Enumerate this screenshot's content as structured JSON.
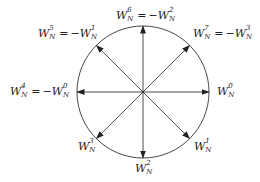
{
  "diagram": {
    "circle": {
      "cx": 143,
      "cy": 92,
      "r": 66,
      "stroke": "#333333"
    },
    "arrow_color": "#222222",
    "labels": [
      {
        "id": "k0",
        "base": "W",
        "sub": "N",
        "sup": "0",
        "text": "W_N^0",
        "equals": ""
      },
      {
        "id": "k1",
        "base": "W",
        "sub": "N",
        "sup": "1",
        "text": "W_N^1",
        "equals": ""
      },
      {
        "id": "k2",
        "base": "W",
        "sub": "N",
        "sup": "2",
        "text": "W_N^2",
        "equals": ""
      },
      {
        "id": "k3",
        "base": "W",
        "sub": "N",
        "sup": "3",
        "text": "W_N^3",
        "equals": ""
      },
      {
        "id": "k4",
        "base": "W",
        "sub": "N",
        "sup": "4",
        "text": "W_N^4 = -W_N^0",
        "equals": "-W_N^0",
        "rhs_sup": "0"
      },
      {
        "id": "k5",
        "base": "W",
        "sub": "N",
        "sup": "5",
        "text": "W_N^5 = -W_N^1",
        "equals": "-W_N^1",
        "rhs_sup": "1"
      },
      {
        "id": "k6",
        "base": "W",
        "sub": "N",
        "sup": "6",
        "text": "W_N^6 = -W_N^2",
        "equals": "-W_N^2",
        "rhs_sup": "2"
      },
      {
        "id": "k7",
        "base": "W",
        "sub": "N",
        "sup": "7",
        "text": "W_N^7 = -W_N^3",
        "equals": "-W_N^3",
        "rhs_sup": "3"
      }
    ],
    "symbols": {
      "W": "W",
      "N": "N",
      "eq": "=",
      "minus": "−"
    }
  }
}
